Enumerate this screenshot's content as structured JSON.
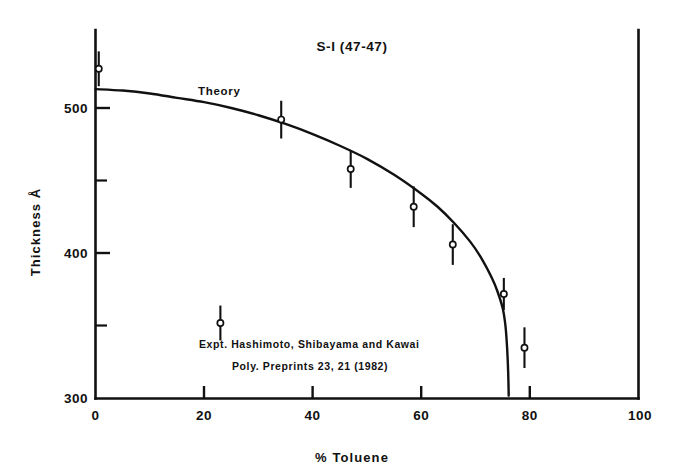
{
  "figure": {
    "title": "S-I  (47-47)",
    "background": "#ffffff",
    "ink_color": "#111111"
  },
  "chart_data": {
    "type": "line",
    "title": "S-I  (47-47)",
    "xlabel": "% Toluene",
    "ylabel": "Thickness Å",
    "xlim": [
      0,
      100
    ],
    "ylim": [
      300,
      540
    ],
    "grid": false,
    "legend_position": "inside-lower-left",
    "x_ticks": [
      0,
      20,
      40,
      60,
      80,
      100
    ],
    "x_tick_labels": [
      "0",
      "20",
      "40",
      "60",
      "80",
      "100"
    ],
    "y_ticks": [
      300,
      400,
      500
    ],
    "y_tick_labels": [
      "300",
      "400",
      "500"
    ],
    "y_minor_ticks": [
      350,
      450
    ],
    "series": [
      {
        "name": "Theory",
        "style": "solid-curve",
        "label": "Theory",
        "label_x": 23.5,
        "label_y": 505,
        "x": [
          0,
          5,
          10,
          15,
          20,
          25,
          30,
          35,
          40,
          45,
          50,
          55,
          60,
          63,
          66,
          69,
          71,
          73,
          74,
          75,
          75.5,
          75.8,
          76.0,
          76.1
        ],
        "y": [
          513,
          512,
          510,
          507,
          504,
          500,
          495,
          489,
          482,
          474,
          465,
          454,
          441,
          432,
          421,
          408,
          397,
          383,
          374,
          362,
          350,
          335,
          318,
          302
        ]
      },
      {
        "name": "Expt.",
        "style": "open-circle-errorbar",
        "label": "Expt.   Hashimoto, Shibayama and Kawai",
        "label_line2": "Poly. Preprints 23, 21 (1982)",
        "points": [
          {
            "x": 0.6,
            "y": 527,
            "err": 12
          },
          {
            "x": 34.2,
            "y": 492,
            "err": 13
          },
          {
            "x": 47.0,
            "y": 458,
            "err": 13
          },
          {
            "x": 58.6,
            "y": 432,
            "err": 14
          },
          {
            "x": 65.8,
            "y": 406,
            "err": 14
          },
          {
            "x": 75.2,
            "y": 372,
            "err": 11
          },
          {
            "x": 79.0,
            "y": 335,
            "err": 14
          }
        ]
      }
    ],
    "legend": {
      "marker_x": 23.0,
      "marker_y": 352,
      "marker_err": 12,
      "line1": "Expt.   Hashimoto, Shibayama and Kawai",
      "line2": "Poly. Preprints 23, 21 (1982)"
    }
  }
}
